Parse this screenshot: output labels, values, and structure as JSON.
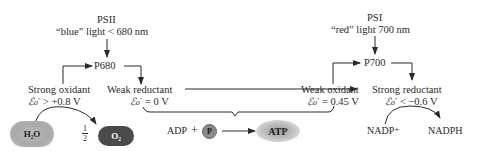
{
  "psii": {
    "title": "PSII",
    "light": "“blue” light  < 680 nm",
    "center": "P680"
  },
  "psi": {
    "title": "PSI",
    "light": "“red” light  700 nm",
    "center": "P700"
  },
  "psii_oxidant": {
    "label": "Strong oxidant",
    "potential_symbol": "ℰ₀′",
    "potential": "> +0.8 V"
  },
  "psii_reductant": {
    "label": "Weak reductant",
    "potential_symbol": "ℰ₀′",
    "potential": "= 0 V"
  },
  "psi_oxidant": {
    "label": "Weak oxidant",
    "potential_symbol": "ℰ₀′",
    "potential": "= 0.45 V"
  },
  "psi_reductant": {
    "label": "Strong reductant",
    "potential_symbol": "ℰ₀′",
    "potential": "< −0.6 V"
  },
  "water_split": {
    "reactant": "H₂O",
    "coefficient_num": "1",
    "coefficient_den": "2",
    "product": "O₂"
  },
  "phosphorylation": {
    "adp": "ADP",
    "plus": "+",
    "pi": "P",
    "atp": "ATP"
  },
  "nadp_reduction": {
    "reactant": "NADP⁺",
    "product": "NADPH"
  },
  "colors": {
    "line": "#2a2a2a",
    "h2o_fill": "#aaaaaa",
    "o2_fill": "#4a4a4a",
    "atp_glow": "#9a9a9a"
  }
}
